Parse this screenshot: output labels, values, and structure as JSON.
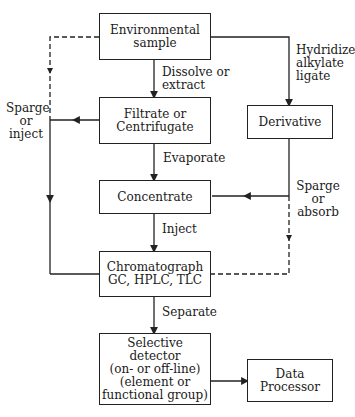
{
  "diagram": {
    "nodes": {
      "environmental_sample": "Environmental\nsample",
      "filtrate": "Filtrate or\nCentrifugate",
      "concentrate": "Concentrate",
      "chromatograph": "Chromatograph\nGC, HPLC, TLC",
      "selective_detector": "Selective\ndetector\n(on- or off-line)\n(element or\nfunctional group)",
      "derivative": "Derivative",
      "data_processor": "Data\nProcessor"
    },
    "edge_labels": {
      "dissolve": "Dissolve or\nextract",
      "evaporate": "Evaporate",
      "inject": "Inject",
      "separate": "Separate",
      "hydridize": "Hydridize\nalkylate\nligate",
      "sparge_absorb": "Sparge\nor\nabsorb",
      "sparge_inject": "Sparge\nor\ninject"
    },
    "colors": {
      "line": "#222222",
      "background": "#ffffff"
    }
  }
}
